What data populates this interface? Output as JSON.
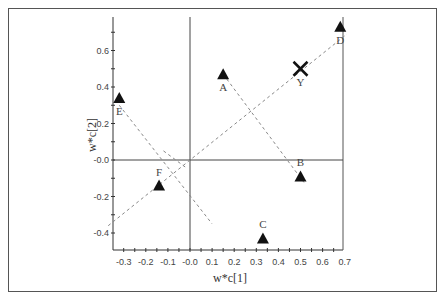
{
  "chart_data": {
    "type": "scatter",
    "title": "",
    "xlabel": "w*c[1]",
    "ylabel": "w*c[2]",
    "xlim": [
      -0.37,
      0.73
    ],
    "ylim": [
      -0.49,
      0.78
    ],
    "x_ticks": [
      "-0.3",
      "-0.2",
      "-0.1",
      "-0.0",
      "0.1",
      "0.2",
      "0.3",
      "0.4",
      "0.5",
      "0.6",
      "0.7"
    ],
    "y_ticks": [
      "0.6",
      "0.4",
      "0.2",
      "-0.0",
      "-0.2",
      "-0.4"
    ],
    "grid": false,
    "reference_lines": [
      "x=0",
      "y=0"
    ],
    "series": [
      {
        "name": "X-variables",
        "marker": "triangle",
        "points": [
          {
            "label": "A",
            "x": 0.15,
            "y": 0.47
          },
          {
            "label": "B",
            "x": 0.5,
            "y": -0.09
          },
          {
            "label": "C",
            "x": 0.33,
            "y": -0.43
          },
          {
            "label": "D",
            "x": 0.68,
            "y": 0.73
          },
          {
            "label": "E",
            "x": -0.32,
            "y": 0.34
          },
          {
            "label": "F",
            "x": -0.14,
            "y": -0.14
          }
        ]
      },
      {
        "name": "Y-variables",
        "marker": "cross",
        "points": [
          {
            "label": "Y",
            "x": 0.5,
            "y": 0.5
          }
        ]
      }
    ],
    "dashed_lines": [
      {
        "from": "E",
        "to": "C-direction",
        "note": "line from E through origin region toward lower right"
      },
      {
        "from": "A",
        "to": "B",
        "note": "line through A and B"
      },
      {
        "from": "lower-left",
        "to": "D",
        "note": "line from lower left through origin and Y to D"
      },
      {
        "from": "F",
        "to": "upper-left",
        "note": "short segment through F region"
      }
    ]
  },
  "axes": {
    "x_title": "w*c[1]",
    "y_title": "w*c[2]"
  }
}
